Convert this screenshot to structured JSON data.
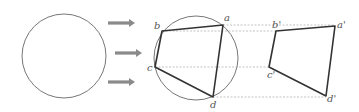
{
  "diagram": {
    "colors": {
      "circle_stroke": "#777777",
      "quad_stroke": "#333333",
      "arrow_fill": "#8a8a8a",
      "dashed_line": "#aaaaaa",
      "label": "#555555"
    },
    "source_circle": {
      "cx": 64,
      "cy": 56,
      "r": 42
    },
    "arrows": [
      {
        "x1": 108,
        "x2": 135,
        "y": 23
      },
      {
        "x1": 115,
        "x2": 142,
        "y": 53
      },
      {
        "x1": 108,
        "x2": 135,
        "y": 82
      }
    ],
    "inscribed_circle": {
      "cx": 196,
      "cy": 58,
      "r": 42
    },
    "inscribed_quad": {
      "points": {
        "a": {
          "label": "a",
          "x": 223,
          "y": 25
        },
        "b": {
          "label": "b",
          "x": 162,
          "y": 31
        },
        "c": {
          "label": "c",
          "x": 155,
          "y": 67
        },
        "d": {
          "label": "d",
          "x": 213,
          "y": 97
        }
      }
    },
    "projected_quad": {
      "points": {
        "a": {
          "label": "a'",
          "x": 335,
          "y": 26
        },
        "b": {
          "label": "b'",
          "x": 276,
          "y": 31
        },
        "c": {
          "label": "c'",
          "x": 269,
          "y": 67
        },
        "d": {
          "label": "d'",
          "x": 326,
          "y": 96
        }
      }
    },
    "guide_lines": [
      {
        "y": 25,
        "x1": 223,
        "x2": 335
      },
      {
        "y": 31,
        "x1": 162,
        "x2": 276
      },
      {
        "y": 67,
        "x1": 155,
        "x2": 269
      },
      {
        "y": 97,
        "x1": 213,
        "x2": 326
      }
    ]
  }
}
